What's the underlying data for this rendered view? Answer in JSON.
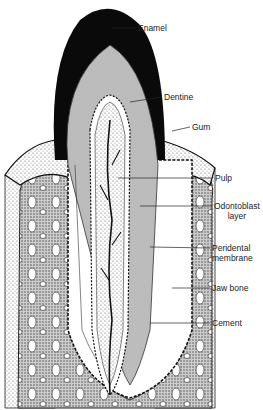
{
  "diagram": {
    "labels": [
      {
        "id": "enamel",
        "text": "Enamel"
      },
      {
        "id": "dentine",
        "text": "Dentine"
      },
      {
        "id": "gum",
        "text": "Gum"
      },
      {
        "id": "pulp",
        "text": "Pulp"
      },
      {
        "id": "odontoblast",
        "text": "Odontoblast layer",
        "line1": "Odontoblast",
        "line2": "layer"
      },
      {
        "id": "peridental",
        "text": "Peridental membrane",
        "line1": "Peridental",
        "line2": "membrane"
      },
      {
        "id": "jawbone",
        "text": "Jaw bone"
      },
      {
        "id": "cement",
        "text": "Cement"
      }
    ]
  }
}
